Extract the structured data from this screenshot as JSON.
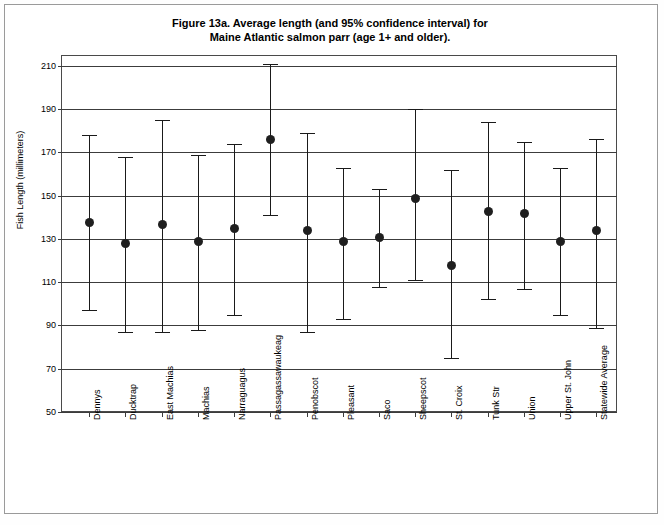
{
  "figure": {
    "title_line1": "Figure 13a. Average length (and 95% confidence interval) for",
    "title_line2": "Maine Atlantic salmon parr (age 1+ and older)."
  },
  "chart_data": {
    "type": "scatter",
    "title": "Figure 13a. Average length (and 95% confidence interval) for Maine Atlantic salmon parr (age 1+ and older).",
    "xlabel": "",
    "ylabel": "Fish Length (millimeters)",
    "ylim": [
      50,
      215
    ],
    "yticks": [
      50,
      70,
      90,
      110,
      130,
      150,
      170,
      190,
      210
    ],
    "grid": true,
    "legend": "none",
    "categories": [
      "Dennys",
      "Ducktrap",
      "East Machias",
      "Machias",
      "Narraguagus",
      "Passagassawaukeag",
      "Penobscot",
      "Pleasant",
      "Saco",
      "Sheepscot",
      "St. Croix",
      "Tunk Str",
      "Union",
      "Upper St. John",
      "Statewide Average"
    ],
    "series": [
      {
        "name": "Average length (mm)",
        "values": [
          138,
          128,
          137,
          129,
          135,
          176,
          134,
          129,
          131,
          149,
          118,
          143,
          142,
          129,
          134
        ]
      },
      {
        "name": "95% CI lower",
        "values": [
          97,
          87,
          87,
          88,
          95,
          141,
          87,
          93,
          108,
          111,
          75,
          102,
          107,
          95,
          89
        ]
      },
      {
        "name": "95% CI upper",
        "values": [
          178,
          168,
          185,
          169,
          174,
          211,
          179,
          163,
          153,
          190,
          162,
          184,
          175,
          163,
          176
        ]
      }
    ]
  }
}
